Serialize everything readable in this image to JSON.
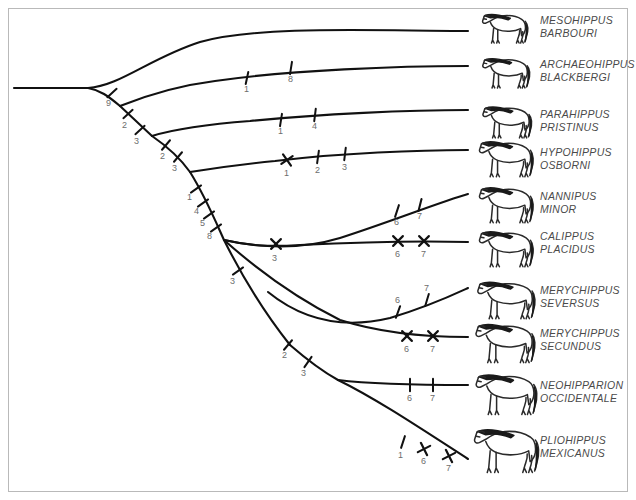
{
  "figure": {
    "type": "cladogram",
    "title": "",
    "background_color": "#ffffff",
    "border_color": "#b9b9b9",
    "line_color": "#111111",
    "label_color": "#4a4a4a",
    "tick_label_color": "#6d6d6d"
  },
  "taxa": [
    {
      "id": "mesohippus",
      "genus": "MESOHIPPUS",
      "species": "BARBOURI",
      "label_x": 540,
      "label_y": 14,
      "icon_x": 478,
      "icon_y": 8,
      "icon_w": 52,
      "icon_h": 36,
      "tip_x": 468,
      "tip_y": 31
    },
    {
      "id": "archaeohippus",
      "genus": "ARCHAEOHIPPUS",
      "species": "BLACKBERGI",
      "label_x": 540,
      "label_y": 58,
      "icon_x": 478,
      "icon_y": 52,
      "icon_w": 54,
      "icon_h": 37,
      "tip_x": 468,
      "tip_y": 66
    },
    {
      "id": "parahippus",
      "genus": "PARAHIPPUS",
      "species": "PRISTINUS",
      "label_x": 540,
      "label_y": 108,
      "icon_x": 478,
      "icon_y": 100,
      "icon_w": 56,
      "icon_h": 39,
      "tip_x": 468,
      "tip_y": 110
    },
    {
      "id": "hypohippus",
      "genus": "HYPOHIPPUS",
      "species": "OSBORNI",
      "label_x": 540,
      "label_y": 146,
      "icon_x": 474,
      "icon_y": 134,
      "icon_w": 62,
      "icon_h": 44,
      "tip_x": 468,
      "tip_y": 150
    },
    {
      "id": "nannipus",
      "genus": "NANNIPUS",
      "species": "MINOR",
      "label_x": 540,
      "label_y": 190,
      "icon_x": 474,
      "icon_y": 180,
      "icon_w": 62,
      "icon_h": 44,
      "tip_x": 468,
      "tip_y": 194
    },
    {
      "id": "calippus",
      "genus": "CALIPPUS",
      "species": "PLACIDUS",
      "label_x": 540,
      "label_y": 230,
      "icon_x": 474,
      "icon_y": 224,
      "icon_w": 62,
      "icon_h": 44,
      "tip_x": 468,
      "tip_y": 242
    },
    {
      "id": "merychippus_s",
      "genus": "MERYCHIPPUS",
      "species": "SEVERSUS",
      "label_x": 540,
      "label_y": 284,
      "icon_x": 472,
      "icon_y": 274,
      "icon_w": 66,
      "icon_h": 46,
      "tip_x": 468,
      "tip_y": 288
    },
    {
      "id": "merychippus_sec",
      "genus": "MERYCHIPPUS",
      "species": "SECUNDUS",
      "label_x": 540,
      "label_y": 327,
      "icon_x": 470,
      "icon_y": 316,
      "icon_w": 68,
      "icon_h": 48,
      "tip_x": 468,
      "tip_y": 337
    },
    {
      "id": "neohipparion",
      "genus": "NEOHIPPARION",
      "species": "OCCIDENTALE",
      "label_x": 540,
      "label_y": 379,
      "icon_x": 470,
      "icon_y": 366,
      "icon_w": 70,
      "icon_h": 50,
      "tip_x": 468,
      "tip_y": 385
    },
    {
      "id": "pliohippus",
      "genus": "PLIOHIPPUS",
      "species": "MEXICANUS",
      "label_x": 540,
      "label_y": 434,
      "icon_x": 468,
      "icon_y": 420,
      "icon_w": 74,
      "icon_h": 54,
      "tip_x": 468,
      "tip_y": 459
    }
  ],
  "trunk_ticks": [
    {
      "label": "9",
      "x": 112,
      "y": 93,
      "angle": 48,
      "type": "bar",
      "lx": 106,
      "ly": 106
    },
    {
      "label": "2",
      "x": 128,
      "y": 114,
      "angle": 48,
      "type": "bar",
      "lx": 122,
      "ly": 128
    },
    {
      "label": "3",
      "x": 140,
      "y": 130,
      "angle": 48,
      "type": "bar",
      "lx": 134,
      "ly": 144
    },
    {
      "label": "2",
      "x": 166,
      "y": 145,
      "angle": 40,
      "type": "bar",
      "lx": 160,
      "ly": 159
    },
    {
      "label": "3",
      "x": 178,
      "y": 157,
      "angle": 40,
      "type": "bar",
      "lx": 172,
      "ly": 171
    },
    {
      "label": "1",
      "x": 196,
      "y": 189,
      "angle": 55,
      "type": "bar",
      "lx": 187,
      "ly": 200
    },
    {
      "label": "4",
      "x": 203,
      "y": 203,
      "angle": 55,
      "type": "bar",
      "lx": 194,
      "ly": 214
    },
    {
      "label": "5",
      "x": 209,
      "y": 215,
      "angle": 55,
      "type": "bar",
      "lx": 200,
      "ly": 226
    },
    {
      "label": "8",
      "x": 216,
      "y": 228,
      "angle": 55,
      "type": "bar",
      "lx": 207,
      "ly": 239
    },
    {
      "label": "3",
      "x": 238,
      "y": 271,
      "angle": 55,
      "type": "bar",
      "lx": 230,
      "ly": 284
    },
    {
      "label": "2",
      "x": 288,
      "y": 345,
      "angle": 40,
      "type": "bar",
      "lx": 282,
      "ly": 358
    },
    {
      "label": "3",
      "x": 308,
      "y": 362,
      "angle": 35,
      "type": "bar",
      "lx": 301,
      "ly": 376
    }
  ],
  "branch_ticks": [
    {
      "taxon": "archaeohippus",
      "label": "1",
      "x": 247,
      "y": 78,
      "angle": 12,
      "type": "bar",
      "lx": 244,
      "ly": 92
    },
    {
      "taxon": "archaeohippus",
      "label": "8",
      "x": 291,
      "y": 68,
      "angle": 9,
      "type": "bar",
      "lx": 288,
      "ly": 82
    },
    {
      "taxon": "parahippus",
      "label": "1",
      "x": 281,
      "y": 120,
      "angle": 9,
      "type": "bar",
      "lx": 278,
      "ly": 134
    },
    {
      "taxon": "parahippus",
      "label": "4",
      "x": 315,
      "y": 115,
      "angle": 7,
      "type": "bar",
      "lx": 312,
      "ly": 129
    },
    {
      "taxon": "hypohippus",
      "label": "1",
      "x": 287,
      "y": 160,
      "angle": 10,
      "type": "cross",
      "lx": 284,
      "ly": 176
    },
    {
      "taxon": "hypohippus",
      "label": "2",
      "x": 318,
      "y": 157,
      "angle": 8,
      "type": "bar",
      "lx": 315,
      "ly": 173
    },
    {
      "taxon": "hypohippus",
      "label": "3",
      "x": 345,
      "y": 154,
      "angle": 7,
      "type": "bar",
      "lx": 342,
      "ly": 170
    },
    {
      "taxon": "nannipus",
      "label": "6",
      "x": 397,
      "y": 211,
      "angle": 18,
      "type": "bar",
      "lx": 394,
      "ly": 225
    },
    {
      "taxon": "nannipus",
      "label": "7",
      "x": 420,
      "y": 205,
      "angle": 14,
      "type": "bar",
      "lx": 417,
      "ly": 219
    },
    {
      "taxon": "calippus",
      "label": "3",
      "x": 276,
      "y": 244,
      "angle": 0,
      "type": "cross",
      "lx": 272,
      "ly": 261
    },
    {
      "taxon": "calippus",
      "label": "6",
      "x": 398,
      "y": 241,
      "angle": 0,
      "type": "cross",
      "lx": 395,
      "ly": 257
    },
    {
      "taxon": "calippus",
      "label": "7",
      "x": 424,
      "y": 241,
      "angle": 0,
      "type": "cross",
      "lx": 421,
      "ly": 257
    },
    {
      "taxon": "merychippus_s",
      "label": "6",
      "x": 398,
      "y": 312,
      "angle": 20,
      "type": "bar",
      "lx": 395,
      "ly": 303
    },
    {
      "taxon": "merychippus_s",
      "label": "7",
      "x": 427,
      "y": 300,
      "angle": 17,
      "type": "bar",
      "lx": 424,
      "ly": 291
    },
    {
      "taxon": "merychippus_sec",
      "label": "6",
      "x": 407,
      "y": 336,
      "angle": 0,
      "type": "cross",
      "lx": 404,
      "ly": 352
    },
    {
      "taxon": "merychippus_sec",
      "label": "7",
      "x": 433,
      "y": 336,
      "angle": 0,
      "type": "cross",
      "lx": 430,
      "ly": 352
    },
    {
      "taxon": "neohipparion",
      "label": "6",
      "x": 410,
      "y": 385,
      "angle": 0,
      "type": "bar",
      "lx": 407,
      "ly": 401
    },
    {
      "taxon": "neohipparion",
      "label": "7",
      "x": 433,
      "y": 385,
      "angle": 0,
      "type": "bar",
      "lx": 430,
      "ly": 401
    },
    {
      "taxon": "pliohippus",
      "label": "1",
      "x": 403,
      "y": 442,
      "angle": 18,
      "type": "bar",
      "lx": 398,
      "ly": 458
    },
    {
      "taxon": "pliohippus",
      "label": "6",
      "x": 424,
      "y": 449,
      "angle": 18,
      "type": "cross",
      "lx": 421,
      "ly": 464
    },
    {
      "taxon": "pliohippus",
      "label": "7",
      "x": 449,
      "y": 456,
      "angle": 18,
      "type": "cross",
      "lx": 446,
      "ly": 471
    }
  ],
  "branch_paths": {
    "root_stem": "M 14 88 L 88 88",
    "mesohippus": "M 88 88 C 120 86 150 58 200 42 C 260 25 380 31 468 31",
    "trunk_1": "M 88 88 C 100 90 108 96 120 106",
    "archaeohippus": "M 120 106 C 145 96 175 86 215 81 C 290 70 400 66 468 66",
    "trunk_2": "M 120 106 L 152 136",
    "parahippus": "M 152 136 C 178 128 210 124 250 121 C 320 114 410 110 468 110",
    "trunk_3": "M 152 136 C 168 147 180 158 190 172",
    "hypohippus": "M 190 172 C 215 168 245 164 275 161 C 340 153 420 150 468 150",
    "trunk_4": "M 190 172 C 205 196 215 220 224 240",
    "nannipus": "M 224 240 C 260 248 300 250 340 238 C 390 222 440 202 468 194",
    "calippus": "M 224 240 C 250 246 270 247 300 245 C 360 242 430 241 468 242",
    "trunk_5": "M 224 240 C 240 272 262 310 290 345",
    "merychippus_sec": "M 224 240 C 260 272 300 300 340 320 C 390 336 440 337 468 337",
    "merychippus_s": "M 268 292 C 300 318 340 330 390 318 C 430 306 455 294 468 288",
    "trunk_6": "M 290 345 C 305 358 320 370 338 380",
    "neohipparion": "M 338 380 C 370 384 410 385 468 385",
    "pliohippus": "M 338 380 C 375 398 420 428 468 459"
  }
}
